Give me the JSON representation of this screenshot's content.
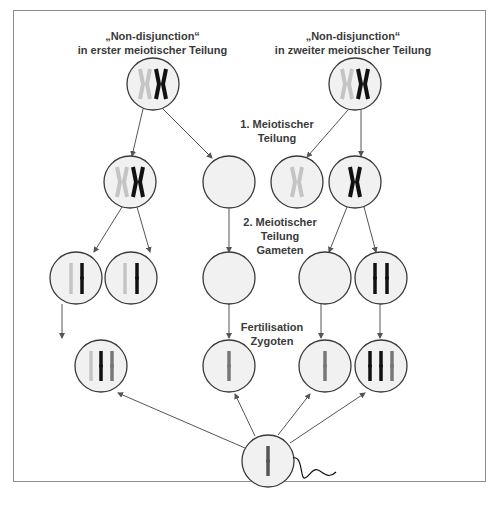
{
  "headers": {
    "left": {
      "line1": "„Non-disjunction“",
      "line2": "in erster meiotischer Teilung"
    },
    "right": {
      "line1": "„Non-disjunction“",
      "line2": "in zweiter meiotischer Teilung"
    }
  },
  "stage_labels": {
    "meiosis1": {
      "line1": "1. Meiotischer",
      "line2": "Teilung"
    },
    "meiosis2": {
      "line1": "2. Meiotischer",
      "line2": "Teilung",
      "line3": "Gameten"
    },
    "fertilisation": {
      "line1": "Fertilisation",
      "line2": "Zygoten"
    }
  },
  "colors": {
    "cell_fill": "#f1f1f1",
    "cell_stroke": "#3a3a3a",
    "chromosome_light": "#c4c4c4",
    "chromosome_dark": "#111111",
    "chromosome_mid": "#777777",
    "arrow": "#555555"
  },
  "cells": {
    "left_parent": "XX (light + dark)",
    "left_m1_a": "XX (light + dark)",
    "left_m1_b": "empty",
    "left_gamete_a": "light + dark chromatid",
    "left_gamete_b": "light + dark chromatid",
    "left_gamete_c": "empty",
    "left_zygote_a": "3 chromosomes (trisomy)",
    "left_zygote_c": "1 chromosome (monosomy)",
    "right_parent": "XX (light + dark)",
    "right_m1_a": "X light",
    "right_m1_b": "X dark",
    "right_gamete_a": "empty",
    "right_gamete_b": "2 dark chromatids",
    "right_zygote_a": "1 chromosome (monosomy)",
    "right_zygote_b": "3 chromosomes (trisomy)",
    "sperm": "1 chromosome"
  }
}
